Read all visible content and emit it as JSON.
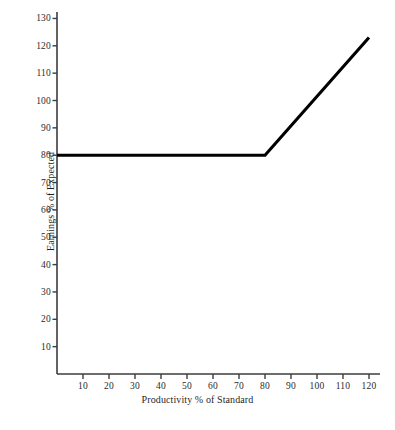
{
  "chart_data": {
    "type": "line",
    "title": "",
    "xlabel": "Productivity % of Standard",
    "ylabel": "Earnings % of Expected",
    "xlim": [
      0,
      124
    ],
    "ylim": [
      0,
      133
    ],
    "xticks": [
      10,
      20,
      30,
      40,
      50,
      60,
      70,
      80,
      90,
      100,
      110,
      120
    ],
    "yticks": [
      10,
      20,
      30,
      40,
      50,
      60,
      70,
      80,
      90,
      100,
      110,
      120,
      130
    ],
    "grid": false,
    "legend": false,
    "series": [
      {
        "name": "Earnings schedule",
        "color": "#000000",
        "x": [
          0,
          80,
          120
        ],
        "values": [
          80,
          80,
          123
        ]
      }
    ],
    "annotations": [
      {
        "note": "Guaranteed minimum earnings of 80% of expected up to 80% of standard productivity; above 80% standard, earnings rise linearly to about 123% at 120% of standard.",
        "breakpoint_x": 80,
        "breakpoint_y": 80
      }
    ]
  },
  "axes": {
    "y_title": "Earnings % of Expected",
    "x_title": "Productivity % of Standard"
  },
  "caption": {
    "text": ""
  },
  "colors": {
    "data_line": "#000000",
    "axis": "#3d3d3d",
    "tick_label": "#2b2b2b",
    "background": "#ffffff"
  }
}
